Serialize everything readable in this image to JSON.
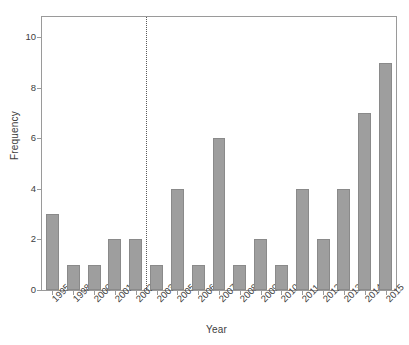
{
  "chart_data": {
    "type": "bar",
    "title": "",
    "xlabel": "Year",
    "ylabel": "Frequency",
    "categories": [
      "1995",
      "1998",
      "2000",
      "2001",
      "2002",
      "2003",
      "2005",
      "2006",
      "2007",
      "2008",
      "2009",
      "2010",
      "2011",
      "2012",
      "2013",
      "2014",
      "2015"
    ],
    "values": [
      3,
      1,
      1,
      2,
      2,
      1,
      4,
      1,
      6,
      1,
      2,
      1,
      4,
      2,
      4,
      7,
      9
    ],
    "ylim": [
      0,
      10.8
    ],
    "yticks": [
      0,
      2,
      4,
      6,
      8,
      10
    ],
    "ytick_labels": [
      "0",
      "2",
      "4",
      "6",
      "8",
      "10"
    ],
    "grid": false,
    "legend": null,
    "annotations": [
      {
        "name": "vertical-dotted-divider",
        "kind": "vline",
        "between": [
          "2002",
          "2003"
        ],
        "style": "dotted",
        "color": "#5a5a5a"
      }
    ],
    "bar_fill_color": "#9e9e9e",
    "bar_edge_color": "#8a8a8a",
    "axis_color": "#9a9a9a",
    "background_color": "#ffffff"
  }
}
